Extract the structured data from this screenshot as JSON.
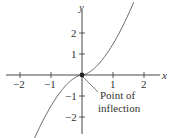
{
  "figure": {
    "x_axis_label": "x",
    "y_axis_label": "y",
    "x_ticks": [
      "−2",
      "−1",
      "1",
      "2"
    ],
    "y_ticks": [
      "2",
      "1",
      "−1",
      "−2"
    ],
    "annotation_line1": "Point of",
    "annotation_line2": "inflection",
    "curve_color": "#555555",
    "axis_color": "#333333"
  },
  "chart_data": {
    "type": "line",
    "title": "",
    "xlabel": "x",
    "ylabel": "y",
    "xlim": [
      -2.5,
      2.5
    ],
    "ylim": [
      -2.5,
      2.5
    ],
    "x_ticks": [
      -2,
      -1,
      1,
      2
    ],
    "y_ticks": [
      -2,
      -1,
      1,
      2
    ],
    "series": [
      {
        "name": "curve",
        "x": [
          -1.67,
          -1,
          0,
          1,
          1.67
        ],
        "y": [
          -2.35,
          -1,
          0,
          1,
          2.35
        ]
      }
    ],
    "annotations": [
      {
        "text": "Point of inflection",
        "x": 0,
        "y": 0
      }
    ],
    "grid": false
  }
}
